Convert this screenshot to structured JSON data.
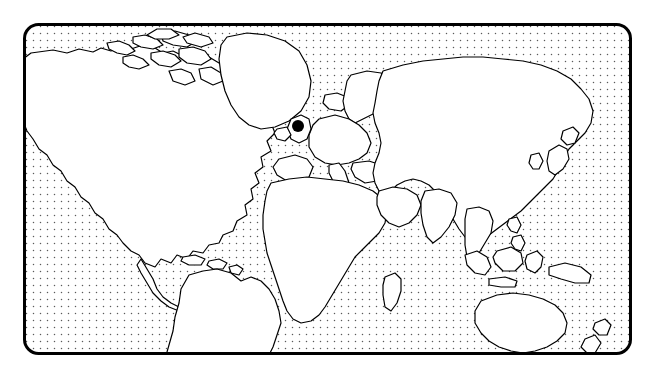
{
  "figure": {
    "type": "world-map-illustration",
    "canvas": {
      "width": 655,
      "height": 378
    },
    "background_color": "#ffffff"
  },
  "frame": {
    "name": "map-border",
    "shape": "rounded-rectangle",
    "x": 23,
    "y": 23,
    "width": 609,
    "height": 332,
    "corner_radius": 14,
    "stroke_color": "#000000",
    "stroke_width": 3,
    "fill_color": "#ffffff"
  },
  "ocean": {
    "name": "ocean-dot-grid",
    "pattern": "dot-grid",
    "dot_color": "#5a5a5a",
    "dot_radius": 0.75,
    "spacing_x": 7,
    "spacing_y": 7
  },
  "land": {
    "name": "landmasses",
    "fill_color": "#ffffff",
    "stroke_color": "#000000",
    "stroke_width": 1.2,
    "regions": [
      "North America",
      "Greenland",
      "Canadian Arctic Archipelago",
      "Iceland",
      "Central America",
      "Caribbean",
      "South America",
      "Europe",
      "Scandinavia",
      "British Isles",
      "Africa",
      "Madagascar",
      "Asia",
      "India",
      "Arabian Peninsula",
      "Japan",
      "Southeast Asia",
      "Indonesia",
      "Philippines",
      "Australia",
      "New Zealand",
      "New Guinea"
    ]
  },
  "marker": {
    "name": "location-marker",
    "shape": "filled-circle",
    "color": "#000000",
    "radius": 6,
    "x": 298,
    "y": 126,
    "approximate_location": "Northern Europe / Denmark",
    "label": ""
  },
  "chart_data": {
    "type": "map",
    "projection": "equirectangular-stylized",
    "points": [
      {
        "name": "marker-1",
        "x_px": 298,
        "y_px": 126,
        "region": "Northern Europe",
        "style": "filled black circle"
      }
    ],
    "legend": [],
    "annotations": []
  }
}
